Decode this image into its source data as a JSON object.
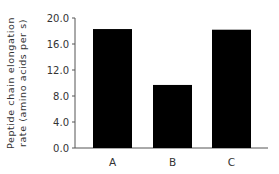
{
  "chart_data": {
    "type": "bar",
    "title": "",
    "xlabel": "",
    "ylabel": [
      "Peptide chain elongation",
      "rate (amino acids per s)"
    ],
    "categories": [
      "A",
      "B",
      "C"
    ],
    "values": [
      18.3,
      9.7,
      18.2
    ],
    "ylim": [
      0,
      20
    ],
    "yticks": [
      0,
      4,
      8,
      12,
      16,
      20
    ],
    "ytick_labels": [
      "0.0",
      "4.0",
      "8.0",
      "12.0",
      "16.0",
      "20.0"
    ],
    "grid": false,
    "legend": null,
    "bar_color": "#000000"
  }
}
